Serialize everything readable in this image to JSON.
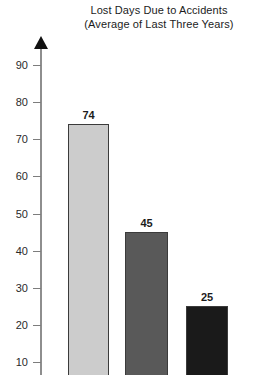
{
  "chart_data": {
    "type": "bar",
    "title": "Lost Days Due to Accidents",
    "subtitle": "(Average of Last Three Years)",
    "title_lines": [
      "Lost Days Due to Accidents",
      "(Average of Last Three Years)"
    ],
    "categories": [
      "",
      "",
      ""
    ],
    "values": [
      74,
      45,
      25
    ],
    "value_labels": [
      "74",
      "45",
      "25"
    ],
    "series": [
      {
        "name": "Lost Days",
        "values": [
          74,
          45,
          25
        ]
      }
    ],
    "bar_colors": [
      "#cccccc",
      "#595959",
      "#1a1a1a"
    ],
    "bar_border_color": "#3b3b3b",
    "xlabel": "",
    "ylabel": "",
    "ylim": [
      0,
      95
    ],
    "y_ticks": [
      90,
      80,
      70,
      60,
      50,
      40,
      30,
      20,
      10
    ],
    "y_tick_labels": [
      "90",
      "80",
      "70",
      "60",
      "50",
      "40",
      "30",
      "20",
      "10"
    ],
    "grid": false,
    "legend": false,
    "legend_position": "none",
    "axis_arrow": true
  },
  "colors": {
    "background": "#ffffff",
    "text": "#1c1c1c",
    "axis": "#8e8e8e",
    "tick": "#7d7d7d",
    "arrow": "#111111"
  }
}
